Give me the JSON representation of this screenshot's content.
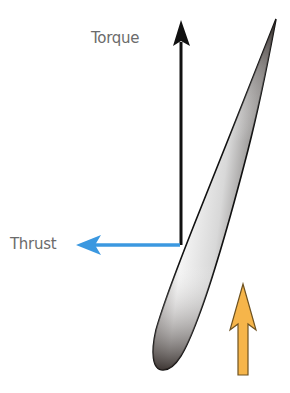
{
  "diagram": {
    "labels": {
      "torque": "Torque",
      "thrust": "Thrust"
    },
    "colors": {
      "torque_arrow": "#111111",
      "thrust_arrow": "#3b98e0",
      "airflow_arrow_fill": "#f6b54a",
      "airflow_arrow_stroke": "#7a5a1e",
      "blade_dark": "#2a2220",
      "blade_light": "#f2f2f2",
      "label_text": "#6b6b6b"
    },
    "elements": [
      {
        "name": "torque-arrow",
        "direction": "up"
      },
      {
        "name": "thrust-arrow",
        "direction": "left"
      },
      {
        "name": "airflow-arrow",
        "direction": "up"
      },
      {
        "name": "blade-cross-section",
        "shape": "airfoil"
      }
    ]
  }
}
